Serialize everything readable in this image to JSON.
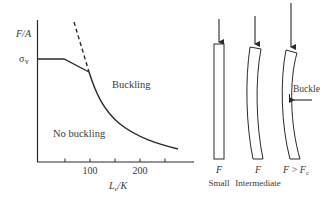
{
  "graph": {
    "y_axis_label": "F/A",
    "y_axis_label_parts": {
      "var1": "F",
      "slash": "/",
      "var2": "A"
    },
    "sigma_label": "σ",
    "sigma_sub": "Y",
    "x_axis_label_parts": {
      "var1": "L",
      "sub": "e",
      "slash": "/",
      "var2": "K"
    },
    "x_ticks": [
      {
        "value": "",
        "x": 65
      },
      {
        "value": "100",
        "x": 90
      },
      {
        "value": "",
        "x": 115
      },
      {
        "value": "200",
        "x": 140
      },
      {
        "value": "",
        "x": 165
      }
    ],
    "tick_label_100": "100",
    "tick_label_200": "200",
    "region_buckling": "Buckling",
    "region_no_buckling": "No buckling"
  },
  "columns": {
    "small": {
      "force_label": "F",
      "caption": "Small"
    },
    "intermediate": {
      "force_label": "F",
      "caption": "Intermediate"
    },
    "critical": {
      "force_label": "F",
      "comparator": " > ",
      "force_crit": "F",
      "force_crit_sub": "c",
      "caption": "",
      "annotation": "Buckle"
    }
  },
  "colors": {
    "line": "#2a2a2a",
    "text": "#3a3a3a",
    "background": "#ffffff"
  }
}
